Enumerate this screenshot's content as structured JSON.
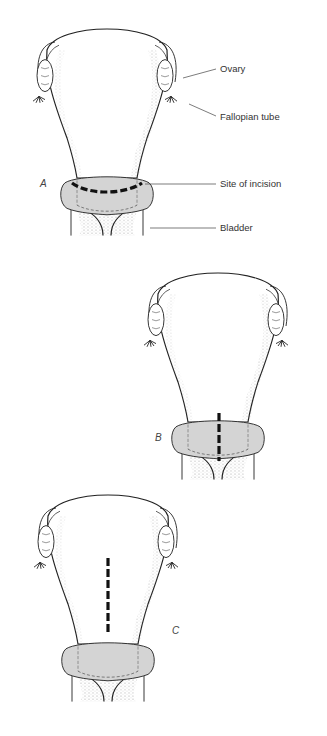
{
  "figure": {
    "panels": [
      {
        "id": "A",
        "label": "A",
        "incision": "transverse"
      },
      {
        "id": "B",
        "label": "B",
        "incision": "low vertical"
      },
      {
        "id": "C",
        "label": "C",
        "incision": "classical vertical"
      }
    ],
    "annotations": {
      "ovary": "Ovary",
      "fallopian_tube": "Fallopian tube",
      "site_of_incision": "Site of incision",
      "bladder": "Bladder"
    },
    "colors": {
      "outline": "#222222",
      "bladder_fill": "#d4d4d4",
      "stipple": "#888888",
      "incision": "#111111",
      "background": "#ffffff"
    }
  }
}
